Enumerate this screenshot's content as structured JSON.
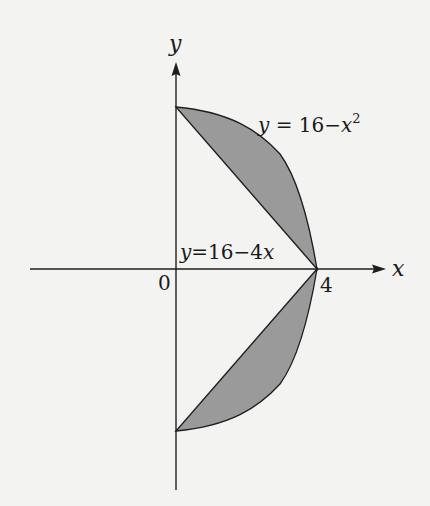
{
  "figure": {
    "axes": {
      "x_label": "x",
      "y_label": "y",
      "origin_label": "0",
      "x_tick_label": "4"
    },
    "curves": [
      {
        "id": "parabola",
        "label_var": "y",
        "label_eq": " = 16−",
        "label_x": "x",
        "label_exp": "2",
        "equation": "y = 16 − x²"
      },
      {
        "id": "line",
        "label_var": "y",
        "label_eq": "=16−4",
        "label_x": "x",
        "equation": "y = 16 − 4x"
      }
    ],
    "regions": [
      {
        "name": "upper-shaded-region",
        "between": [
          "y = 16 − x²",
          "y = 16 − 4x"
        ],
        "x_range": [
          0,
          4
        ]
      },
      {
        "name": "lower-shaded-region",
        "between": [
          "y = x² − 16",
          "y = 4x − 16"
        ],
        "x_range": [
          0,
          4
        ],
        "note": "reflection of upper region across x-axis"
      }
    ],
    "colors": {
      "fill": "#9a9a9a",
      "stroke": "#1e1e1e",
      "background": "#f3f3f1"
    }
  }
}
